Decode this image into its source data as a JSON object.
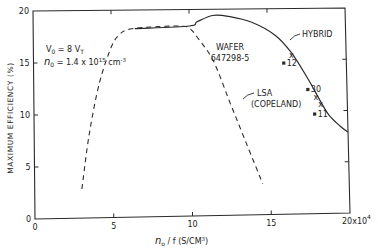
{
  "chart_data": {
    "type": "line",
    "title": "",
    "xlabel": "n_o / f  (S/CM³)",
    "xlabel_parts": {
      "symbol": "n",
      "sub": "o",
      "rest": " / f   (S/CM",
      "sup": "3",
      "close": ")"
    },
    "ylabel": "MAXIMUM  EFFICIENCY  (%)",
    "xlim": [
      0,
      20
    ],
    "ylim": [
      0,
      20
    ],
    "x_multiplier_label": "x10",
    "x_multiplier_exp": "4",
    "xticks": [
      0,
      5,
      10,
      15,
      20
    ],
    "xtick_labels": [
      "0",
      "5",
      "10",
      "15",
      "20"
    ],
    "yticks": [
      0,
      5,
      10,
      15,
      20
    ],
    "ytick_labels": [
      "0",
      "5",
      "10",
      "15",
      "20"
    ],
    "grid": false,
    "series": [
      {
        "name": "LSA (COPELAND)",
        "style": "dashed",
        "x": [
          3.0,
          3.5,
          4.2,
          5.0,
          5.5,
          6.0,
          7.0,
          8.5,
          9.5,
          10.0,
          10.5,
          11.5,
          12.5,
          13.5,
          14.5
        ],
        "y": [
          2.8,
          8.0,
          13.0,
          16.5,
          17.6,
          18.1,
          18.3,
          18.4,
          18.4,
          18.2,
          17.3,
          15.0,
          11.0,
          7.0,
          3.0
        ]
      },
      {
        "name": "HYBRID",
        "style": "solid",
        "x": [
          6.5,
          10.0,
          10.5,
          11.5,
          12.5,
          14.0,
          15.5,
          16.5,
          17.5,
          18.2,
          18.8,
          19.5,
          20.0
        ],
        "y": [
          18.2,
          18.4,
          18.8,
          19.4,
          19.3,
          18.7,
          17.4,
          15.7,
          13.2,
          11.2,
          9.6,
          8.5,
          7.9
        ]
      },
      {
        "name": "Measured (x)",
        "style": "marker-x",
        "x": [
          16.5,
          18.0,
          18.3
        ],
        "y": [
          15.5,
          11.4,
          10.7
        ]
      },
      {
        "name": "Measured (square)",
        "style": "marker-square",
        "x": [
          16.0,
          17.5,
          17.9
        ],
        "y": [
          14.7,
          12.1,
          9.7
        ],
        "labels": [
          "12",
          "30",
          "11"
        ]
      }
    ],
    "annotations": [
      {
        "text": "HYBRID",
        "target": "hybrid curve"
      },
      {
        "text": "LSA",
        "text2": "(COPELAND)",
        "target": "dashed curve"
      },
      {
        "text": "WAFER",
        "text2": "647298-5"
      },
      {
        "text": "V0 = 8 VT",
        "parts": {
          "a": "V",
          "a_sub": "0",
          "b": " = 8 V",
          "b_sub": "T"
        }
      },
      {
        "text": "n0 = 1.4 x 10^15 cm^-3",
        "parts": {
          "a": "n",
          "a_sub": "0",
          "b": " = 1.4 x 10",
          "b_sup": "15",
          "c": " cm",
          "c_sup": "-3"
        }
      }
    ],
    "legend": "none (curves labeled inline)"
  },
  "colors": {
    "ink": "#2a2a2a",
    "background": "#ffffff"
  }
}
